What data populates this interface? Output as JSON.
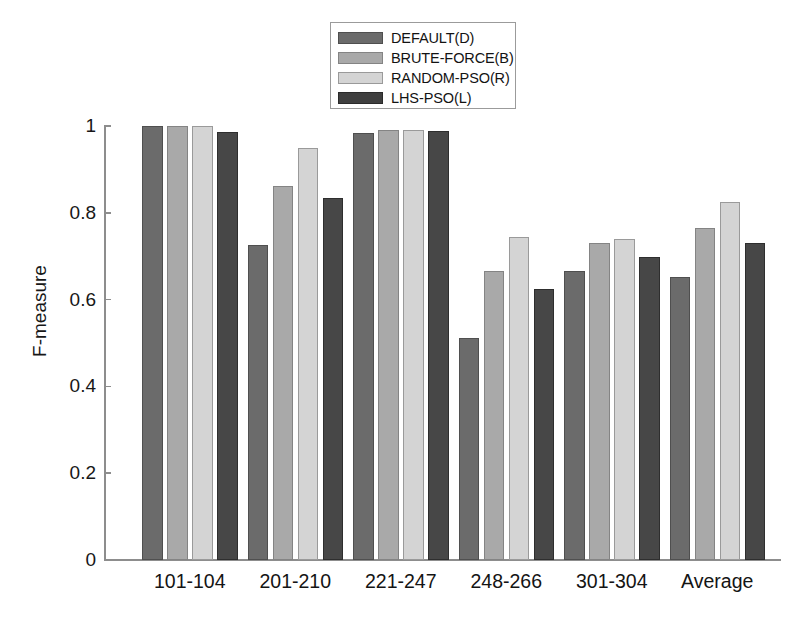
{
  "chart_data": {
    "type": "bar",
    "title": "",
    "xlabel": "",
    "ylabel": "F-measure",
    "ylim": [
      0,
      1
    ],
    "yticks": [
      "0",
      "0.2",
      "0.4",
      "0.6",
      "0.8",
      "1"
    ],
    "ytick_values": [
      0,
      0.2,
      0.4,
      0.6,
      0.8,
      1
    ],
    "grid": false,
    "legend_position": "top-center",
    "categories": [
      "101-104",
      "201-210",
      "221-247",
      "248-266",
      "301-304",
      "Average"
    ],
    "series": [
      {
        "name": "DEFAULT(D)",
        "color": "#6b6b6b",
        "values": [
          1.0,
          0.725,
          0.985,
          0.512,
          0.665,
          0.652
        ]
      },
      {
        "name": "BRUTE-FORCE(B)",
        "color": "#a9a9a9",
        "values": [
          1.0,
          0.862,
          0.99,
          0.665,
          0.73,
          0.764
        ]
      },
      {
        "name": "RANDOM-PSO(R)",
        "color": "#d4d4d4",
        "values": [
          1.0,
          0.95,
          0.99,
          0.745,
          0.74,
          0.826
        ]
      },
      {
        "name": "LHS-PSO(L)",
        "color": "#3f3f3f",
        "values": [
          0.987,
          0.835,
          0.988,
          0.625,
          0.698,
          0.731
        ]
      }
    ]
  },
  "legend": {
    "entries": [
      {
        "label": "DEFAULT(D)"
      },
      {
        "label": "BRUTE-FORCE(B)"
      },
      {
        "label": "RANDOM-PSO(R)"
      },
      {
        "label": "LHS-PSO(L)"
      }
    ]
  },
  "colors": {
    "axis": "#8d8d8d",
    "text": "#141414",
    "background": "#ffffff",
    "series_0": "#6b6b6b",
    "series_1": "#a9a9a9",
    "series_2": "#d4d4d4",
    "series_3": "#3f3f3f"
  }
}
